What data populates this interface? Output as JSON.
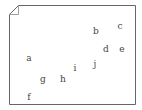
{
  "figure": {
    "type": "scatter-labels-on-page",
    "border_color": "#666666",
    "text_color": "#444444",
    "page_shape": "folded-corner-document",
    "labels": [
      {
        "text": "a",
        "x": 29,
        "y": 58
      },
      {
        "text": "b",
        "x": 96,
        "y": 31
      },
      {
        "text": "c",
        "x": 120,
        "y": 26
      },
      {
        "text": "d",
        "x": 106,
        "y": 49
      },
      {
        "text": "e",
        "x": 122,
        "y": 49
      },
      {
        "text": "f",
        "x": 29,
        "y": 97
      },
      {
        "text": "g",
        "x": 43,
        "y": 79
      },
      {
        "text": "h",
        "x": 63,
        "y": 79
      },
      {
        "text": "i",
        "x": 75,
        "y": 68
      },
      {
        "text": "j",
        "x": 95,
        "y": 64
      }
    ]
  }
}
